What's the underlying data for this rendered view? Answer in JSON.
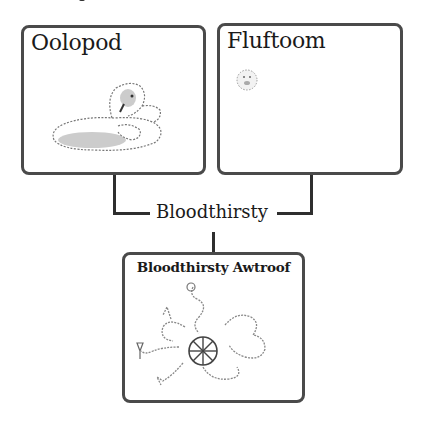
{
  "diagram": {
    "parents": [
      {
        "name": "Oolopod",
        "illustration": "sheep-like creature lying down"
      },
      {
        "name": "Fluftoom",
        "illustration": "small fluffy round creature"
      }
    ],
    "operator": {
      "label": "Bloodthirsty"
    },
    "result": {
      "name": "Bloodthirsty Awtroof",
      "illustration": "tentacled creature with central wheel"
    },
    "colors": {
      "border": "#4a4a4a",
      "line": "#2e2e2e",
      "text": "#1a1a1a",
      "background": "#ffffff"
    }
  }
}
